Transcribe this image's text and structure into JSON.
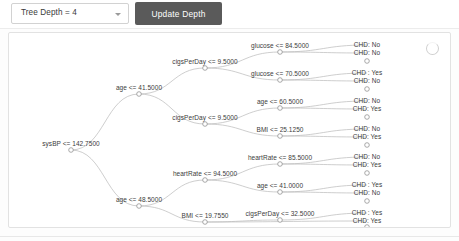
{
  "toolbar": {
    "depth_select_value": "Tree Depth = 4",
    "depth_caret_icon": "chevron-down-icon",
    "update_button_label": "Update Depth"
  },
  "card": {
    "spinner_icon": "loading-spinner-icon"
  },
  "chart_data": {
    "type": "diagram",
    "title": "",
    "subtype": "decision-tree",
    "max_depth": 4,
    "split_operator": "<=",
    "leaf_classes": [
      "CHD: No",
      "CHD : Yes"
    ],
    "nodes": [
      {
        "id": "n0",
        "label": "sysBP <= 142.7500",
        "depth": 0,
        "x": 62,
        "y": 117,
        "leaf": false
      },
      {
        "id": "n1",
        "label": "age <= 41.5000",
        "depth": 1,
        "x": 130,
        "y": 61,
        "leaf": false
      },
      {
        "id": "n2",
        "label": "age <= 48.5000",
        "depth": 1,
        "x": 130,
        "y": 173,
        "leaf": false
      },
      {
        "id": "n3",
        "label": "cigsPerDay <= 9.5000",
        "depth": 2,
        "x": 196,
        "y": 35,
        "leaf": false
      },
      {
        "id": "n4",
        "label": "cigsPerDay <= 9.5000",
        "depth": 2,
        "x": 196,
        "y": 91,
        "leaf": false
      },
      {
        "id": "n5",
        "label": "heartRate <= 94.5000",
        "depth": 2,
        "x": 196,
        "y": 147,
        "leaf": false
      },
      {
        "id": "n6",
        "label": "BMI <= 19.7550",
        "depth": 2,
        "x": 196,
        "y": 189,
        "leaf": false
      },
      {
        "id": "n7",
        "label": "glucose <= 84.5000",
        "depth": 3,
        "x": 271,
        "y": 19,
        "leaf": false
      },
      {
        "id": "n8",
        "label": "glucose <= 70.5000",
        "depth": 3,
        "x": 271,
        "y": 47,
        "leaf": false
      },
      {
        "id": "n9",
        "label": "age <= 60.5000",
        "depth": 3,
        "x": 271,
        "y": 75,
        "leaf": false
      },
      {
        "id": "n10",
        "label": "BMI <= 25.1250",
        "depth": 3,
        "x": 271,
        "y": 103,
        "leaf": false
      },
      {
        "id": "n11",
        "label": "heartRate <= 85.5000",
        "depth": 3,
        "x": 271,
        "y": 131,
        "leaf": false
      },
      {
        "id": "n12",
        "label": "age <= 41.0000",
        "depth": 3,
        "x": 271,
        "y": 159,
        "leaf": false
      },
      {
        "id": "n13",
        "label": "cigsPerDay <= 32.5000",
        "depth": 3,
        "x": 271,
        "y": 187,
        "leaf": false
      },
      {
        "id": "l1",
        "label": "CHD: No",
        "depth": 4,
        "x": 358,
        "y": 12,
        "leaf": true
      },
      {
        "id": "l2",
        "label": "CHD: No",
        "depth": 4,
        "x": 358,
        "y": 20,
        "leaf": true
      },
      {
        "id": "l3",
        "label": "CHD : Yes",
        "depth": 4,
        "x": 358,
        "y": 40,
        "leaf": true
      },
      {
        "id": "l4",
        "label": "CHD: No",
        "depth": 4,
        "x": 358,
        "y": 48,
        "leaf": true
      },
      {
        "id": "l5",
        "label": "CHD: No",
        "depth": 4,
        "x": 358,
        "y": 68,
        "leaf": true
      },
      {
        "id": "l6",
        "label": "CHD: Yes",
        "depth": 4,
        "x": 358,
        "y": 76,
        "leaf": true
      },
      {
        "id": "l7",
        "label": "CHD: No",
        "depth": 4,
        "x": 358,
        "y": 96,
        "leaf": true
      },
      {
        "id": "l8",
        "label": "CHD: Yes",
        "depth": 4,
        "x": 358,
        "y": 104,
        "leaf": true
      },
      {
        "id": "l9",
        "label": "CHD: No",
        "depth": 4,
        "x": 358,
        "y": 124,
        "leaf": true
      },
      {
        "id": "l10",
        "label": "CHD: Yes",
        "depth": 4,
        "x": 358,
        "y": 132,
        "leaf": true
      },
      {
        "id": "l11",
        "label": "CHD : Yes",
        "depth": 4,
        "x": 358,
        "y": 152,
        "leaf": true
      },
      {
        "id": "l12",
        "label": "CHD: No",
        "depth": 4,
        "x": 358,
        "y": 160,
        "leaf": true
      },
      {
        "id": "l13",
        "label": "CHD : Yes",
        "depth": 4,
        "x": 358,
        "y": 180,
        "leaf": true
      },
      {
        "id": "l14",
        "label": "CHD: Yes",
        "depth": 4,
        "x": 358,
        "y": 188,
        "leaf": true
      }
    ],
    "edges": [
      [
        "n0",
        "n1"
      ],
      [
        "n0",
        "n2"
      ],
      [
        "n1",
        "n3"
      ],
      [
        "n1",
        "n4"
      ],
      [
        "n2",
        "n5"
      ],
      [
        "n2",
        "n6"
      ],
      [
        "n3",
        "n7"
      ],
      [
        "n3",
        "n8"
      ],
      [
        "n4",
        "n9"
      ],
      [
        "n4",
        "n10"
      ],
      [
        "n5",
        "n11"
      ],
      [
        "n5",
        "n12"
      ],
      [
        "n6",
        "n13"
      ],
      [
        "n6",
        "l14"
      ],
      [
        "n7",
        "l1"
      ],
      [
        "n7",
        "l2"
      ],
      [
        "n8",
        "l3"
      ],
      [
        "n8",
        "l4"
      ],
      [
        "n9",
        "l5"
      ],
      [
        "n9",
        "l6"
      ],
      [
        "n10",
        "l7"
      ],
      [
        "n10",
        "l8"
      ],
      [
        "n11",
        "l9"
      ],
      [
        "n11",
        "l10"
      ],
      [
        "n12",
        "l11"
      ],
      [
        "n12",
        "l12"
      ],
      [
        "n13",
        "l13"
      ]
    ]
  }
}
